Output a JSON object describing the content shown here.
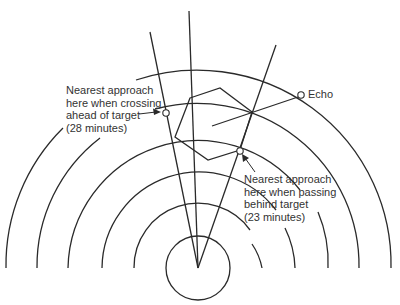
{
  "diagram": {
    "type": "radar-plot",
    "center": {
      "x": 198,
      "y": 268
    },
    "colors": {
      "line": "#2a2a2a",
      "text": "#333333",
      "background": "#ffffff"
    },
    "echo_label": "Echo",
    "annotations": {
      "crossing_ahead": {
        "lines": [
          "Nearest approach",
          "here when crossing",
          "ahead of target",
          "(28 minutes)"
        ]
      },
      "passing_behind": {
        "lines": [
          "Nearest approach",
          "here when passing",
          "behind target",
          "(23 minutes)"
        ]
      }
    },
    "range_rings_count": 6,
    "bearing_lines_count": 3
  }
}
